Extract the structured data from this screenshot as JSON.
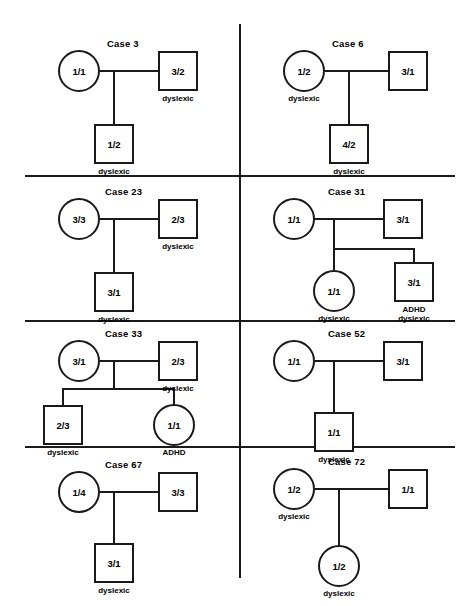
{
  "figure": {
    "width": 475,
    "height": 606,
    "background": "#ffffff",
    "line_color": "#1a1a1a",
    "affection_label_dyslexic": "dyslexic",
    "affection_label_adhd": "ADHD",
    "affection_label_adhd_dyslexic": "ADHD\ndyslexic"
  },
  "panels": [
    {
      "id": "case-3",
      "title": "Case 3",
      "mother": {
        "shape": "circle",
        "genotype": "1/1",
        "label": ""
      },
      "father": {
        "shape": "square",
        "genotype": "3/2",
        "label": "dyslexic"
      },
      "children": [
        {
          "shape": "square",
          "genotype": "1/2",
          "label": "dyslexic"
        }
      ]
    },
    {
      "id": "case-6",
      "title": "Case 6",
      "mother": {
        "shape": "circle",
        "genotype": "1/2",
        "label": "dyslexic"
      },
      "father": {
        "shape": "square",
        "genotype": "3/1",
        "label": ""
      },
      "children": [
        {
          "shape": "square",
          "genotype": "4/2",
          "label": "dyslexic"
        }
      ]
    },
    {
      "id": "case-23",
      "title": "Case 23",
      "mother": {
        "shape": "circle",
        "genotype": "3/3",
        "label": ""
      },
      "father": {
        "shape": "square",
        "genotype": "2/3",
        "label": "dyslexic"
      },
      "children": [
        {
          "shape": "square",
          "genotype": "3/1",
          "label": "dyslexic"
        }
      ]
    },
    {
      "id": "case-31",
      "title": "Case 31",
      "mother": {
        "shape": "circle",
        "genotype": "1/1",
        "label": ""
      },
      "father": {
        "shape": "square",
        "genotype": "3/1",
        "label": ""
      },
      "children": [
        {
          "shape": "circle",
          "genotype": "1/1",
          "label": "dyslexic"
        },
        {
          "shape": "square",
          "genotype": "3/1",
          "label_line1": "ADHD",
          "label_line2": "dyslexic"
        }
      ]
    },
    {
      "id": "case-33",
      "title": "Case 33",
      "mother": {
        "shape": "circle",
        "genotype": "3/1",
        "label": ""
      },
      "father": {
        "shape": "square",
        "genotype": "2/3",
        "label": "dyslexic"
      },
      "children": [
        {
          "shape": "square",
          "genotype": "2/3",
          "label": "dyslexic"
        },
        {
          "shape": "circle",
          "genotype": "1/1",
          "label": "ADHD"
        }
      ]
    },
    {
      "id": "case-52",
      "title": "Case 52",
      "mother": {
        "shape": "circle",
        "genotype": "1/1",
        "label": ""
      },
      "father": {
        "shape": "square",
        "genotype": "3/1",
        "label": ""
      },
      "children": [
        {
          "shape": "square",
          "genotype": "1/1",
          "label": "dyslexic"
        }
      ]
    },
    {
      "id": "case-67",
      "title": "Case 67",
      "mother": {
        "shape": "circle",
        "genotype": "1/4",
        "label": ""
      },
      "father": {
        "shape": "square",
        "genotype": "3/3",
        "label": ""
      },
      "children": [
        {
          "shape": "square",
          "genotype": "3/1",
          "label": "dyslexic"
        }
      ]
    },
    {
      "id": "case-72",
      "title": "Case 72",
      "mother": {
        "shape": "circle",
        "genotype": "1/2",
        "label": "dyslexic"
      },
      "father": {
        "shape": "square",
        "genotype": "1/1",
        "label": ""
      },
      "children": [
        {
          "shape": "circle",
          "genotype": "1/2",
          "label": "dyslexic"
        }
      ]
    }
  ]
}
